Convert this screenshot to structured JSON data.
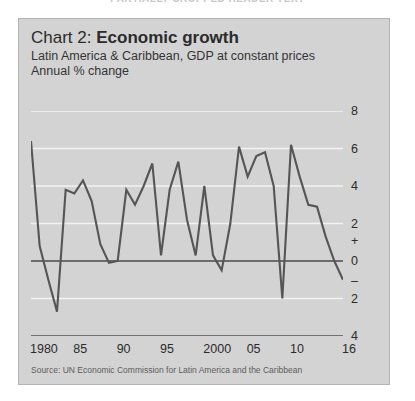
{
  "page_header": "PARTIALLY CROPPED HEADER TEXT",
  "panel": {
    "title_prefix": "Chart 2: ",
    "title_main": "Economic growth",
    "subtitle_line1": "Latin America & Caribbean, GDP at constant prices",
    "subtitle_line2": "Annual % change",
    "source": "Source: UN Economic Commission for Latin America and the Caribbean",
    "background_color": "#d3d3d3",
    "line_color": "#555555",
    "gridline_color": "#f2f2f2",
    "zero_line_color": "#4a4a4a"
  },
  "chart_data": {
    "type": "line",
    "title": "Chart 2: Economic growth",
    "subtitle": "Latin America & Caribbean, GDP at constant prices",
    "ylabel": "Annual % change",
    "xlabel": "",
    "ylim": [
      -4,
      8
    ],
    "xlim": [
      1980,
      2016
    ],
    "grid": true,
    "legend": "none",
    "y_ticks": [
      8,
      6,
      4,
      2,
      0,
      -2,
      -4
    ],
    "y_tick_labels": [
      "8",
      "6",
      "4",
      "2",
      "0",
      "2",
      "4"
    ],
    "sign_marker_positive": "+",
    "sign_marker_negative": "–",
    "x_tick_labels": [
      "1980",
      "85",
      "90",
      "95",
      "2000",
      "05",
      "10",
      "16"
    ],
    "x_tick_years": [
      1980,
      1985,
      1990,
      1995,
      2000,
      2005,
      2010,
      2016
    ],
    "x_minor_tick_interval": 1,
    "series": [
      {
        "name": "GDP annual % change",
        "x": [
          1980,
          1981,
          1982,
          1983,
          1984,
          1985,
          1986,
          1987,
          1988,
          1989,
          1990,
          1991,
          1992,
          1993,
          1994,
          1995,
          1996,
          1997,
          1998,
          1999,
          2000,
          2001,
          2002,
          2003,
          2004,
          2005,
          2006,
          2007,
          2008,
          2009,
          2010,
          2011,
          2012,
          2013,
          2014,
          2015,
          2016
        ],
        "values": [
          6.4,
          0.8,
          -1.0,
          -2.7,
          3.8,
          3.6,
          4.3,
          3.2,
          0.9,
          -0.1,
          0.0,
          3.8,
          3.0,
          4.0,
          5.2,
          0.3,
          3.8,
          5.3,
          2.2,
          0.3,
          4.0,
          0.3,
          -0.5,
          2.0,
          6.1,
          4.5,
          5.6,
          5.8,
          4.0,
          -2.0,
          6.2,
          4.5,
          3.0,
          2.9,
          1.3,
          0.0,
          -1.0
        ]
      }
    ]
  }
}
